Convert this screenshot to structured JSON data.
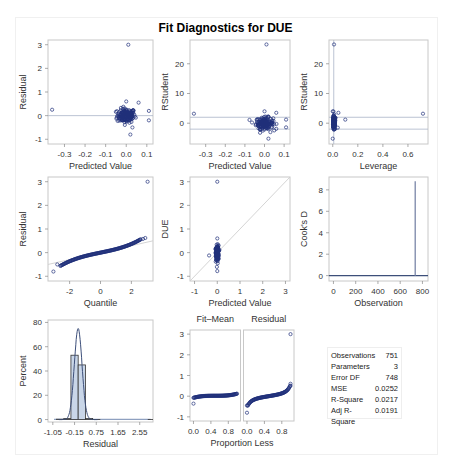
{
  "title": "Fit Diagnostics for DUE",
  "colors": {
    "point": "#1f2f7a",
    "frame": "#c8c8c8",
    "refline": "#a9b4c8",
    "hist_fill": "#c9d6e8",
    "hist_edge": "#333333",
    "curve": "#3d4f7a"
  },
  "stats": {
    "rows": [
      {
        "label": "Observations",
        "value": "751"
      },
      {
        "label": "Parameters",
        "value": "3"
      },
      {
        "label": "Error DF",
        "value": "748"
      },
      {
        "label": "MSE",
        "value": "0.0252"
      },
      {
        "label": "R-Square",
        "value": "0.0217"
      },
      {
        "label": "Adj R-Square",
        "value": "0.0191"
      }
    ]
  },
  "chart_data": [
    {
      "id": "resid_vs_pred",
      "type": "scatter",
      "title": "",
      "xlabel": "Predicted Value",
      "ylabel": "Residual",
      "xlim": [
        -0.38,
        0.13
      ],
      "ylim": [
        -1.2,
        3.2
      ],
      "xticks": [
        -0.3,
        -0.2,
        -0.1,
        0.0,
        0.1
      ],
      "xtick_labels": [
        "-0.3",
        "-0.2",
        "-0.1",
        "0.0",
        "0.1"
      ],
      "yticks": [
        -1,
        0,
        1,
        2,
        3
      ],
      "ytick_labels": [
        "-1",
        "0",
        "1",
        "2",
        "3"
      ],
      "hlines": [
        0
      ],
      "outliers": [
        {
          "x": -0.36,
          "y": 0.25
        },
        {
          "x": 0.01,
          "y": 3.0
        },
        {
          "x": 0.02,
          "y": -0.8
        },
        {
          "x": 0.03,
          "y": -0.5
        },
        {
          "x": 0.11,
          "y": 0.2
        },
        {
          "x": 0.11,
          "y": -0.2
        },
        {
          "x": 0.06,
          "y": 0.55
        },
        {
          "x": 0.0,
          "y": 0.6
        }
      ],
      "cluster": {
        "x_center": 0.0,
        "x_sd": 0.022,
        "y_center": 0.0,
        "y_sd": 0.15,
        "n": 160
      }
    },
    {
      "id": "rstudent_vs_pred",
      "type": "scatter",
      "xlabel": "Predicted Value",
      "ylabel": "RStudent",
      "xlim": [
        -0.38,
        0.13
      ],
      "ylim": [
        -7,
        28
      ],
      "xticks": [
        -0.3,
        -0.2,
        -0.1,
        0.0,
        0.1
      ],
      "xtick_labels": [
        "-0.3",
        "-0.2",
        "-0.1",
        "0.0",
        "0.1"
      ],
      "yticks": [
        0,
        10,
        20
      ],
      "ytick_labels": [
        "0",
        "10",
        "20"
      ],
      "hlines": [
        2,
        -2
      ],
      "outliers": [
        {
          "x": -0.36,
          "y": 3.2
        },
        {
          "x": 0.01,
          "y": 26.5
        },
        {
          "x": 0.02,
          "y": -5.2
        },
        {
          "x": 0.03,
          "y": -3.0
        },
        {
          "x": 0.11,
          "y": 1.2
        },
        {
          "x": 0.11,
          "y": -1.4
        },
        {
          "x": 0.06,
          "y": 3.5
        },
        {
          "x": 0.0,
          "y": 4.0
        }
      ],
      "cluster": {
        "x_center": 0.0,
        "x_sd": 0.022,
        "y_center": 0.0,
        "y_sd": 0.95,
        "n": 160
      }
    },
    {
      "id": "rstudent_vs_leverage",
      "type": "scatter",
      "xlabel": "Leverage",
      "ylabel": "RStudent",
      "xlim": [
        -0.03,
        0.76
      ],
      "ylim": [
        -7,
        28
      ],
      "xticks": [
        0.0,
        0.2,
        0.4,
        0.6
      ],
      "xtick_labels": [
        "0.0",
        "0.2",
        "0.4",
        "0.6"
      ],
      "yticks": [
        0,
        10,
        20
      ],
      "ytick_labels": [
        "0",
        "10",
        "20"
      ],
      "hlines": [
        2,
        -2
      ],
      "vlines": [
        0.008
      ],
      "outliers": [
        {
          "x": 0.72,
          "y": 3.2
        },
        {
          "x": 0.01,
          "y": 26.5
        },
        {
          "x": 0.1,
          "y": 1.2
        },
        {
          "x": 0.045,
          "y": 3.5
        },
        {
          "x": 0.04,
          "y": -1.5
        },
        {
          "x": 0.0,
          "y": -5.2
        },
        {
          "x": 0.0,
          "y": 4.0
        }
      ],
      "cluster": {
        "x_center": 0.008,
        "x_sd": 0.008,
        "y_center": 0.0,
        "y_sd": 1.2,
        "n": 120
      }
    },
    {
      "id": "qq_plot",
      "type": "scatter",
      "xlabel": "Quantile",
      "ylabel": "Residual",
      "xlim": [
        -3.4,
        3.4
      ],
      "ylim": [
        -1.2,
        3.2
      ],
      "xticks": [
        -2,
        0,
        2
      ],
      "xtick_labels": [
        "-2",
        "0",
        "2"
      ],
      "yticks": [
        -1,
        0,
        1,
        2,
        3
      ],
      "ytick_labels": [
        "-1",
        "0",
        "1",
        "2",
        "3"
      ],
      "refline": [
        [
          -3.4,
          -0.5
        ],
        [
          3.4,
          0.5
        ]
      ],
      "outliers": [
        {
          "x": -3.05,
          "y": -0.8
        },
        {
          "x": -2.8,
          "y": -0.5
        },
        {
          "x": 2.75,
          "y": 0.58
        },
        {
          "x": 2.9,
          "y": 0.62
        },
        {
          "x": 3.05,
          "y": 3.0
        }
      ]
    },
    {
      "id": "observed_vs_pred",
      "type": "scatter",
      "xlabel": "Predicted Value",
      "ylabel": "DUE",
      "xlim": [
        -1.2,
        3.2
      ],
      "ylim": [
        -1.2,
        3.2
      ],
      "xticks": [
        -1,
        0,
        1,
        2,
        3
      ],
      "xtick_labels": [
        "-1",
        "0",
        "1",
        "2",
        "3"
      ],
      "yticks": [
        -1,
        0,
        1,
        2,
        3
      ],
      "ytick_labels": [
        "-1",
        "0",
        "1",
        "2",
        "3"
      ],
      "refline": [
        [
          -1.2,
          -1.2
        ],
        [
          3.2,
          3.2
        ]
      ],
      "outliers": [
        {
          "x": 0.0,
          "y": 3.0
        },
        {
          "x": -0.36,
          "y": -0.12
        },
        {
          "x": 0.0,
          "y": -0.78
        },
        {
          "x": 0.02,
          "y": -0.45
        },
        {
          "x": 0.0,
          "y": 0.6
        }
      ],
      "cluster": {
        "x_center": 0.0,
        "x_sd": 0.03,
        "y_center": 0.0,
        "y_sd": 0.15,
        "n": 180
      }
    },
    {
      "id": "cooks_d",
      "type": "line",
      "xlabel": "Observation",
      "ylabel": "Cook's D",
      "xlim": [
        -40,
        850
      ],
      "ylim": [
        -0.5,
        9.2
      ],
      "xticks": [
        0,
        200,
        400,
        600,
        800
      ],
      "xtick_labels": [
        "0",
        "200",
        "400",
        "600",
        "800"
      ],
      "yticks": [
        0,
        2,
        4,
        6,
        8
      ],
      "ytick_labels": [
        "0",
        "2",
        "4",
        "6",
        "8"
      ],
      "n_obs": 751,
      "spikes": [
        {
          "x": 735,
          "y": 8.8
        }
      ]
    },
    {
      "id": "resid_histogram",
      "type": "bar",
      "xlabel": "Residual",
      "ylabel": "Percent",
      "xlim": [
        -1.25,
        3.1
      ],
      "ylim": [
        -2,
        82
      ],
      "xticks": [
        -1.05,
        -0.15,
        0.75,
        1.65,
        2.55
      ],
      "xtick_labels": [
        "-1.05",
        "-0.15",
        "0.75",
        "1.65",
        "2.55"
      ],
      "yticks": [
        0,
        20,
        40,
        60,
        80
      ],
      "ytick_labels": [
        "0",
        "20",
        "40",
        "60",
        "80"
      ],
      "bin_width": 0.3,
      "bins": [
        {
          "start": -0.9,
          "pct": 0.3
        },
        {
          "start": -0.6,
          "pct": 0.8
        },
        {
          "start": -0.3,
          "pct": 53
        },
        {
          "start": 0.0,
          "pct": 45
        },
        {
          "start": 0.3,
          "pct": 0.9
        },
        {
          "start": 0.6,
          "pct": 0.1
        },
        {
          "start": 2.9,
          "pct": 0.13
        }
      ],
      "normal_curve": {
        "mean": 0.0,
        "sd": 0.159,
        "peak_pct": 75
      },
      "kernel_curve_range": [
        -1.0,
        3.0
      ]
    },
    {
      "id": "residual_fit_spread",
      "type": "scatter",
      "panels": [
        "Fit–Mean",
        "Residual"
      ],
      "xlabel": "Proportion Less",
      "ylabel": "",
      "xlim": [
        -0.08,
        1.08
      ],
      "ylim": [
        -1.2,
        3.2
      ],
      "xticks": [
        0.0,
        0.4,
        0.8
      ],
      "xtick_labels": [
        "0.0",
        "0.4",
        "0.8"
      ],
      "yticks": [
        -1,
        0,
        1,
        2,
        3
      ],
      "ytick_labels": [
        "-1",
        "0",
        "1",
        "2",
        "3"
      ],
      "fit_mean_range": [
        -0.08,
        0.12
      ],
      "fit_mean_outlier": {
        "x": 0.0,
        "y": -0.36
      },
      "residual_outliers": [
        {
          "x": 0.0,
          "y": -0.8
        },
        {
          "x": 1.0,
          "y": 3.0
        },
        {
          "x": 1.0,
          "y": 0.6
        }
      ]
    }
  ]
}
